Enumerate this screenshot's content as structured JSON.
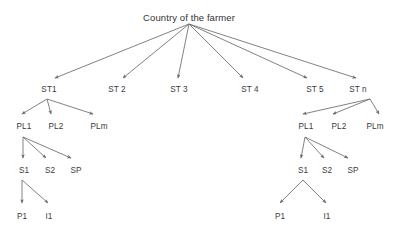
{
  "diagram": {
    "title": "Country of the farmer",
    "type": "hierarchy-tree",
    "edge_color": "#6b6b6b",
    "text_color": "#3a3a3a",
    "background": "#ffffff",
    "levels": [
      {
        "name": "root",
        "labels": [
          "Country of the farmer"
        ]
      },
      {
        "name": "stratum",
        "labels": [
          "ST1",
          "ST 2",
          "ST 3",
          "ST 4",
          "ST 5",
          "ST n"
        ]
      },
      {
        "name": "place",
        "labels": [
          "PL1",
          "PL2",
          "PLm"
        ]
      },
      {
        "name": "segment",
        "labels": [
          "S1",
          "S2",
          "SP"
        ]
      },
      {
        "name": "leaf",
        "labels": [
          "P1",
          "I1"
        ]
      }
    ],
    "nodes": {
      "root": {
        "label": "Country of the farmer",
        "x": 189,
        "y": 12
      },
      "st1": {
        "label": "ST1",
        "x": 49,
        "y": 85
      },
      "st2": {
        "label": "ST 2",
        "x": 117,
        "y": 85
      },
      "st3": {
        "label": "ST 3",
        "x": 179,
        "y": 85
      },
      "st4": {
        "label": "ST 4",
        "x": 250,
        "y": 85
      },
      "st5": {
        "label": "ST 5",
        "x": 315,
        "y": 85
      },
      "stn": {
        "label": "ST n",
        "x": 358,
        "y": 85
      },
      "left_pl1": {
        "label": "PL1",
        "x": 24,
        "y": 122
      },
      "left_pl2": {
        "label": "PL2",
        "x": 56,
        "y": 122
      },
      "left_plm": {
        "label": "PLm",
        "x": 99,
        "y": 122
      },
      "left_s1": {
        "label": "S1",
        "x": 24,
        "y": 166
      },
      "left_s2": {
        "label": "S2",
        "x": 50,
        "y": 166
      },
      "left_sp": {
        "label": "SP",
        "x": 76,
        "y": 166
      },
      "left_p1": {
        "label": "P1",
        "x": 22,
        "y": 212
      },
      "left_i1": {
        "label": "I1",
        "x": 49,
        "y": 212
      },
      "right_pl1": {
        "label": "PL1",
        "x": 306,
        "y": 122
      },
      "right_pl2": {
        "label": "PL2",
        "x": 339,
        "y": 122
      },
      "right_plm": {
        "label": "PLm",
        "x": 375,
        "y": 122
      },
      "right_s1": {
        "label": "S1",
        "x": 303,
        "y": 166
      },
      "right_s2": {
        "label": "S2",
        "x": 327,
        "y": 166
      },
      "right_sp": {
        "label": "SP",
        "x": 353,
        "y": 166
      },
      "right_p1": {
        "label": "P1",
        "x": 280,
        "y": 212
      },
      "right_i1": {
        "label": "I1",
        "x": 327,
        "y": 212
      }
    },
    "edges": [
      {
        "from": "root",
        "to": "st1",
        "x1": 189,
        "y1": 24,
        "x2": 55,
        "y2": 78
      },
      {
        "from": "root",
        "to": "st2",
        "x1": 189,
        "y1": 24,
        "x2": 123,
        "y2": 78
      },
      {
        "from": "root",
        "to": "st3",
        "x1": 189,
        "y1": 24,
        "x2": 178,
        "y2": 78
      },
      {
        "from": "root",
        "to": "st4",
        "x1": 189,
        "y1": 24,
        "x2": 243,
        "y2": 78
      },
      {
        "from": "root",
        "to": "st5",
        "x1": 189,
        "y1": 24,
        "x2": 307,
        "y2": 78
      },
      {
        "from": "root",
        "to": "stn",
        "x1": 189,
        "y1": 24,
        "x2": 356,
        "y2": 78
      },
      {
        "from": "st1",
        "to": "left_pl1",
        "x1": 47,
        "y1": 99,
        "x2": 22,
        "y2": 114
      },
      {
        "from": "st1",
        "to": "left_pl2",
        "x1": 47,
        "y1": 99,
        "x2": 51,
        "y2": 114
      },
      {
        "from": "st1",
        "to": "left_plm",
        "x1": 47,
        "y1": 99,
        "x2": 93,
        "y2": 114
      },
      {
        "from": "left_pl1",
        "to": "left_s1",
        "x1": 23,
        "y1": 137,
        "x2": 23,
        "y2": 158
      },
      {
        "from": "left_pl1",
        "to": "left_s2",
        "x1": 23,
        "y1": 137,
        "x2": 46,
        "y2": 158
      },
      {
        "from": "left_pl1",
        "to": "left_sp",
        "x1": 23,
        "y1": 137,
        "x2": 71,
        "y2": 158
      },
      {
        "from": "left_s1",
        "to": "left_p1",
        "x1": 22,
        "y1": 180,
        "x2": 22,
        "y2": 203
      },
      {
        "from": "left_s1",
        "to": "left_i1",
        "x1": 22,
        "y1": 180,
        "x2": 48,
        "y2": 203
      },
      {
        "from": "stn",
        "to": "right_pl1",
        "x1": 370,
        "y1": 99,
        "x2": 303,
        "y2": 114
      },
      {
        "from": "stn",
        "to": "right_pl2",
        "x1": 370,
        "y1": 99,
        "x2": 333,
        "y2": 114
      },
      {
        "from": "stn",
        "to": "right_plm",
        "x1": 370,
        "y1": 99,
        "x2": 379,
        "y2": 114
      },
      {
        "from": "right_pl1",
        "to": "right_s1",
        "x1": 305,
        "y1": 137,
        "x2": 301,
        "y2": 158
      },
      {
        "from": "right_pl1",
        "to": "right_s2",
        "x1": 305,
        "y1": 137,
        "x2": 324,
        "y2": 158
      },
      {
        "from": "right_pl1",
        "to": "right_sp",
        "x1": 305,
        "y1": 137,
        "x2": 348,
        "y2": 158
      },
      {
        "from": "right_s1",
        "to": "right_p1",
        "x1": 303,
        "y1": 180,
        "x2": 280,
        "y2": 203
      },
      {
        "from": "right_s1",
        "to": "right_i1",
        "x1": 303,
        "y1": 180,
        "x2": 326,
        "y2": 203
      }
    ]
  }
}
